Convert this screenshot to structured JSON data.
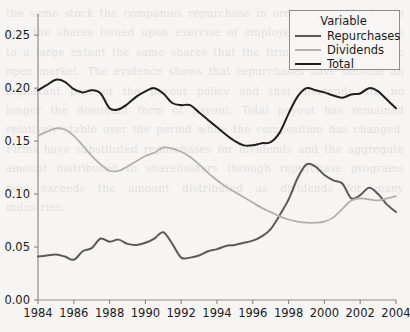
{
  "chart_data": {
    "type": "line",
    "title": "",
    "xlabel": "",
    "ylabel": "",
    "xlim": [
      1984,
      2004
    ],
    "ylim": [
      0.0,
      0.27
    ],
    "grid": false,
    "legend_position": "top-right",
    "legend_title": "Variable",
    "xticks": [
      "1984",
      "1986",
      "1988",
      "1990",
      "1992",
      "1994",
      "1996",
      "1998",
      "2000",
      "2002",
      "2004"
    ],
    "xtick_values": [
      1984,
      1986,
      1988,
      1990,
      1992,
      1994,
      1996,
      1998,
      2000,
      2002,
      2004
    ],
    "yticks": [
      "0.00",
      "0.05",
      "0.10",
      "0.15",
      "0.20",
      "0.25"
    ],
    "ytick_values": [
      0.0,
      0.05,
      0.1,
      0.15,
      0.2,
      0.25
    ],
    "x": [
      1984,
      1984.5,
      1985,
      1985.5,
      1986,
      1986.5,
      1987,
      1987.5,
      1988,
      1988.5,
      1989,
      1989.5,
      1990,
      1990.5,
      1991,
      1991.5,
      1992,
      1992.5,
      1993,
      1993.5,
      1994,
      1994.5,
      1995,
      1995.5,
      1996,
      1996.5,
      1997,
      1997.5,
      1998,
      1998.5,
      1999,
      1999.5,
      2000,
      2000.5,
      2001,
      2001.5,
      2002,
      2002.5,
      2003,
      2003.5,
      2004
    ],
    "series": [
      {
        "name": "Repurchases",
        "color": "#5a5a5a",
        "values": [
          0.041,
          0.042,
          0.043,
          0.041,
          0.038,
          0.046,
          0.049,
          0.058,
          0.055,
          0.057,
          0.053,
          0.052,
          0.054,
          0.058,
          0.064,
          0.053,
          0.04,
          0.04,
          0.042,
          0.046,
          0.048,
          0.051,
          0.052,
          0.054,
          0.056,
          0.06,
          0.067,
          0.08,
          0.095,
          0.115,
          0.128,
          0.126,
          0.118,
          0.113,
          0.11,
          0.096,
          0.099,
          0.106,
          0.1,
          0.09,
          0.083
        ]
      },
      {
        "name": "Dividends",
        "color": "#b0b0b0",
        "values": [
          0.155,
          0.159,
          0.162,
          0.161,
          0.155,
          0.146,
          0.136,
          0.128,
          0.122,
          0.122,
          0.126,
          0.131,
          0.136,
          0.139,
          0.144,
          0.143,
          0.14,
          0.135,
          0.128,
          0.12,
          0.113,
          0.107,
          0.102,
          0.097,
          0.092,
          0.087,
          0.083,
          0.079,
          0.076,
          0.074,
          0.073,
          0.073,
          0.074,
          0.078,
          0.086,
          0.094,
          0.096,
          0.095,
          0.094,
          0.096,
          0.098
        ]
      },
      {
        "name": "Total",
        "color": "#1f1f1f",
        "values": [
          0.198,
          0.203,
          0.208,
          0.206,
          0.199,
          0.196,
          0.198,
          0.195,
          0.181,
          0.18,
          0.185,
          0.192,
          0.197,
          0.2,
          0.195,
          0.186,
          0.184,
          0.184,
          0.177,
          0.17,
          0.163,
          0.156,
          0.15,
          0.146,
          0.146,
          0.148,
          0.149,
          0.158,
          0.176,
          0.192,
          0.2,
          0.198,
          0.196,
          0.193,
          0.191,
          0.194,
          0.195,
          0.2,
          0.197,
          0.189,
          0.181
        ]
      }
    ]
  },
  "legend": {
    "title": "Variable",
    "entries": [
      {
        "label": "Repurchases",
        "color": "#5a5a5a"
      },
      {
        "label": "Dividends",
        "color": "#b0b0b0"
      },
      {
        "label": "Total",
        "color": "#1f1f1f"
      }
    ]
  },
  "colors": {
    "background": "#f6f5f3",
    "axis": "#8d8d8d",
    "text": "#1a1a1a"
  },
  "ghost_text": "the same stock the companies repurchase in order to avoid dilution and the shares issued upon exercise of employee stock options are to a large extent the same shares that the firms repurchase in the open market. The evidence shows that repurchases have become an important part of the payout policy and that dividends are no longer the dominant form of payout. Total payout has remained relatively stable over the period while the composition has changed. Firms have substituted repurchases for dividends and the aggregate amount distributed to shareholders through repurchase programs now exceeds the amount distributed as dividends for many industries."
}
